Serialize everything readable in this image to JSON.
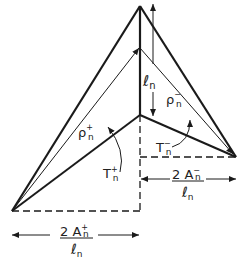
{
  "diagram": {
    "labels": {
      "edge_length": "ℓ",
      "edge_sub": "n",
      "rho_plus": "ρ",
      "rho_plus_sup": "+",
      "rho_plus_sub": "n",
      "rho_minus": "ρ",
      "rho_minus_sup": "−",
      "rho_minus_sub": "n",
      "t_plus": "T",
      "t_plus_sup": "+",
      "t_plus_sub": "n",
      "t_minus": "T",
      "t_minus_sup": "−",
      "t_minus_sub": "n",
      "width_plus_num": "2 A",
      "width_plus_sup": "+",
      "width_plus_sub": "n",
      "width_plus_den": "ℓ",
      "width_plus_den_sub": "n",
      "width_minus_num": "2 A",
      "width_minus_sup": "−",
      "width_minus_sub": "n",
      "width_minus_den": "ℓ",
      "width_minus_den_sub": "n"
    },
    "colors": {
      "stroke": "#1a1a1a",
      "background": "#ffffff"
    }
  }
}
